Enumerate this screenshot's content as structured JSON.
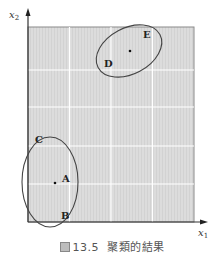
{
  "figure": {
    "caption_prefix": "圖",
    "caption_number": "13.5",
    "caption_text": "聚類的結果",
    "x_axis_label": "x",
    "x_axis_subscript": "1",
    "y_axis_label": "x",
    "y_axis_subscript": "2",
    "panel_color": "#dcdcdc",
    "grid_color": "#ffffff",
    "ellipse_color": "#444444"
  },
  "clusters": [
    {
      "name": "cluster-DE",
      "points": [
        {
          "label": "D"
        },
        {
          "label": "E"
        }
      ]
    },
    {
      "name": "cluster-ABC",
      "points": [
        {
          "label": "A"
        },
        {
          "label": "B"
        },
        {
          "label": "C"
        }
      ]
    }
  ]
}
